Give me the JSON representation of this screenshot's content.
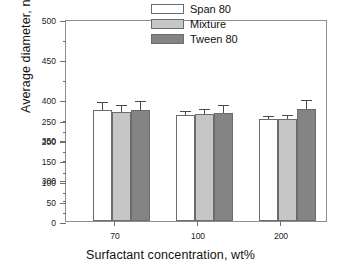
{
  "chart_data": {
    "type": "bar",
    "title": "",
    "xlabel": "Surfactant concentration, wt%",
    "ylabel": "Average diameter, nm",
    "categories": [
      "70",
      "100",
      "200"
    ],
    "ylim": [
      0,
      500
    ],
    "yticks": [
      0,
      50,
      100,
      150,
      200,
      250,
      300,
      350,
      400,
      450,
      500
    ],
    "ytick_labels": [
      "0",
      "50",
      "100",
      "150",
      "200",
      "250",
      "300",
      "350",
      "400",
      "450",
      "500"
    ],
    "grid": false,
    "legend_position": "top-right",
    "series": [
      {
        "name": "Span 80",
        "color": "#ffffff",
        "values": [
          276,
          263,
          253
        ],
        "errors": [
          17,
          8,
          5
        ]
      },
      {
        "name": "Mixture",
        "color": "#c6c6c6",
        "values": [
          271,
          264,
          252
        ],
        "errors": [
          14,
          12,
          9
        ]
      },
      {
        "name": "Tween 80",
        "color": "#848484",
        "values": [
          274,
          268,
          278
        ],
        "errors": [
          20,
          17,
          18
        ]
      }
    ]
  },
  "axes": {
    "y_title": "Average diameter, nm",
    "x_title": "Surfactant concentration, wt%",
    "y_tick_500": "500",
    "y_tick_450": "450",
    "y_tick_400": "400",
    "y_tick_350": "350",
    "y_tick_300": "300",
    "y_tick_250": "250",
    "y_tick_200": "200",
    "y_tick_150": "150",
    "y_tick_100": "100",
    "y_tick_50": "50",
    "y_tick_0": "0",
    "x_tick_1": "70",
    "x_tick_2": "100",
    "x_tick_3": "200"
  },
  "legend": {
    "items": [
      {
        "label": "Span 80",
        "color": "#ffffff"
      },
      {
        "label": "Mixture",
        "color": "#c6c6c6"
      },
      {
        "label": "Tween 80",
        "color": "#848484"
      }
    ]
  }
}
